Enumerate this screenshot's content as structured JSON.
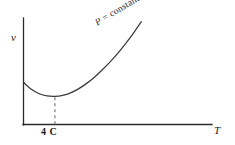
{
  "chart_data": {
    "type": "line",
    "title": "",
    "subtitle": "",
    "xlabel": "T",
    "ylabel": "v",
    "annotations": [
      {
        "text": "P = constant",
        "symbol": "P",
        "rest": " = constant",
        "rotation_deg": -31
      }
    ],
    "x_tick_labels": [
      "4 C"
    ],
    "x_tick_values": [
      4
    ],
    "y_tick_labels": [],
    "grid": false,
    "legend": false,
    "legend_position": "none",
    "xlim": [
      0,
      24
    ],
    "ylim": [
      0,
      12
    ],
    "series": [
      {
        "name": "P = constant",
        "comment": "specific volume of water vs temperature, minimum at 4 C",
        "x": [
          0,
          1,
          2,
          3,
          4,
          5,
          6,
          7,
          8,
          9,
          10,
          11,
          12,
          13,
          14,
          15
        ],
        "y": [
          4.8,
          4.0,
          3.5,
          3.25,
          3.2,
          3.32,
          3.6,
          4.05,
          4.65,
          5.35,
          6.2,
          7.1,
          8.1,
          9.2,
          10.4,
          11.7
        ]
      }
    ],
    "markers": [
      {
        "name": "minimum-dropline",
        "style": "dashed-vertical",
        "x": 4,
        "y": 3.2
      }
    ],
    "colors": {
      "axis": "#2b2b2b",
      "curve": "#3a3a3a",
      "dashed": "#6e6e6e",
      "text": "#1a1a1a",
      "background": "#ffffff"
    }
  },
  "axes": {
    "y_label": "v",
    "x_label": "T"
  },
  "ticks": {
    "x_4c": "4 C"
  },
  "annotation": {
    "symbol": "P",
    "rest": " = constant",
    "full": "P = constant"
  }
}
